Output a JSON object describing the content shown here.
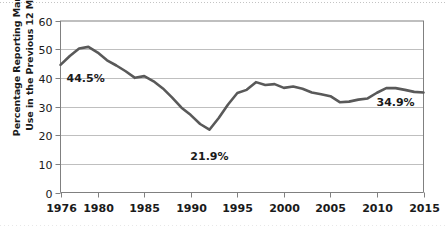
{
  "chart_data": {
    "type": "line",
    "title": "",
    "xlabel": "",
    "ylabel": "Percentage Reporting Marijuana Use in the Previous 12 Months",
    "ylabel_line1": "Percentage Reporting Marijuana",
    "ylabel_line2": "Use in the Previous 12 Months",
    "xlim": [
      1976,
      2015
    ],
    "ylim": [
      0,
      60
    ],
    "y_ticks": [
      0,
      10,
      20,
      30,
      40,
      50,
      60
    ],
    "y_tick_labels": [
      "0",
      "10",
      "20",
      "30",
      "40",
      "50",
      "60"
    ],
    "x_ticks": [
      1976,
      1980,
      1985,
      1990,
      1995,
      2000,
      2005,
      2010,
      2015
    ],
    "x_tick_labels": [
      "1976",
      "1980",
      "1985",
      "1990",
      "1995",
      "2000",
      "2005",
      "2010",
      "2015"
    ],
    "grid": "horizontal",
    "legend": "none",
    "line_color": "#595959",
    "grid_color": "#bfbfbf",
    "axis_color": "#808080",
    "x": [
      1976,
      1977,
      1978,
      1979,
      1980,
      1981,
      1982,
      1983,
      1984,
      1985,
      1986,
      1987,
      1988,
      1989,
      1990,
      1991,
      1992,
      1993,
      1994,
      1995,
      1996,
      1997,
      1998,
      1999,
      2000,
      2001,
      2002,
      2003,
      2004,
      2005,
      2006,
      2007,
      2008,
      2009,
      2010,
      2011,
      2012,
      2013,
      2014,
      2015
    ],
    "values": [
      44.5,
      47.6,
      50.2,
      50.8,
      48.8,
      46.1,
      44.3,
      42.3,
      40.0,
      40.6,
      38.8,
      36.3,
      33.1,
      29.6,
      27.0,
      23.9,
      21.9,
      26.0,
      30.7,
      34.7,
      35.8,
      38.5,
      37.5,
      37.8,
      36.5,
      37.0,
      36.2,
      34.9,
      34.3,
      33.6,
      31.5,
      31.7,
      32.4,
      32.8,
      34.8,
      36.4,
      36.4,
      35.8,
      35.1,
      34.9
    ],
    "annotations": [
      {
        "name": "start-value",
        "text": "44.5%",
        "x": 1976,
        "y": 44.5
      },
      {
        "name": "minimum-value",
        "text": "21.9%",
        "x": 1992,
        "y": 21.9
      },
      {
        "name": "end-value",
        "text": "34.9%",
        "x": 2012,
        "y": 34.9
      }
    ]
  }
}
